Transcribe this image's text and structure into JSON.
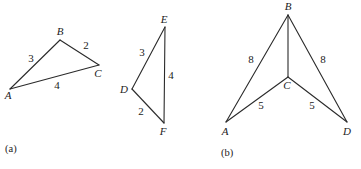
{
  "figure_a": {
    "caption": "(a)",
    "triangle_abc": {
      "vertices": {
        "A": {
          "label": "A",
          "x": 10,
          "y": 89,
          "lx": 8,
          "ly": 99
        },
        "B": {
          "label": "B",
          "x": 60,
          "y": 40,
          "lx": 60,
          "ly": 35
        },
        "C": {
          "label": "C",
          "x": 99,
          "y": 65,
          "lx": 98,
          "ly": 77
        }
      },
      "edges": [
        {
          "from": "A",
          "to": "B",
          "length": "3",
          "lx": 31,
          "ly": 62
        },
        {
          "from": "B",
          "to": "C",
          "length": "2",
          "lx": 86,
          "ly": 49
        },
        {
          "from": "A",
          "to": "C",
          "length": "4",
          "lx": 57,
          "ly": 89
        }
      ]
    },
    "triangle_def": {
      "vertices": {
        "D": {
          "label": "D",
          "x": 132,
          "y": 89,
          "lx": 124,
          "ly": 93
        },
        "E": {
          "label": "E",
          "x": 165,
          "y": 27,
          "lx": 164,
          "ly": 23
        },
        "F": {
          "label": "F",
          "x": 164,
          "y": 123,
          "lx": 163,
          "ly": 135
        }
      },
      "edges": [
        {
          "from": "D",
          "to": "E",
          "length": "3",
          "lx": 142,
          "ly": 56
        },
        {
          "from": "E",
          "to": "F",
          "length": "4",
          "lx": 171,
          "ly": 79
        },
        {
          "from": "D",
          "to": "F",
          "length": "2",
          "lx": 141,
          "ly": 115
        }
      ]
    }
  },
  "figure_b": {
    "caption": "(b)",
    "vertices": {
      "A": {
        "label": "A",
        "x": 226,
        "y": 122,
        "lx": 225,
        "ly": 135
      },
      "B": {
        "label": "B",
        "x": 288,
        "y": 15,
        "lx": 288,
        "ly": 10
      },
      "C": {
        "label": "C",
        "x": 288,
        "y": 77,
        "lx": 287,
        "ly": 89
      },
      "D": {
        "label": "D",
        "x": 347,
        "y": 122,
        "lx": 347,
        "ly": 135
      }
    },
    "edges": [
      {
        "from": "A",
        "to": "B",
        "length": "8",
        "lx": 251,
        "ly": 63
      },
      {
        "from": "B",
        "to": "D",
        "length": "8",
        "lx": 323,
        "ly": 63
      },
      {
        "from": "B",
        "to": "C",
        "length": "",
        "lx": 0,
        "ly": 0
      },
      {
        "from": "A",
        "to": "C",
        "length": "5",
        "lx": 261,
        "ly": 109
      },
      {
        "from": "C",
        "to": "D",
        "length": "5",
        "lx": 312,
        "ly": 109
      }
    ]
  }
}
